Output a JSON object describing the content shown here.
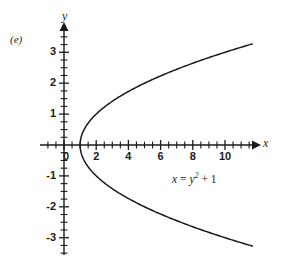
{
  "figure": {
    "panel_label": "(e)",
    "background_color": "#ffffff",
    "ink_color": "#1a1a1a"
  },
  "annotation": {
    "equation_lhs": "x",
    "equation_eq": "=",
    "equation_base": "y",
    "equation_exponent": "2",
    "equation_tail": "+ 1",
    "equation_full": "x = y2 + 1"
  },
  "axes": {
    "x_label": "x",
    "y_label": "y",
    "x_tick_labels": [
      "0",
      "2",
      "4",
      "6",
      "8",
      "10"
    ],
    "x_tick_values": [
      0,
      2,
      4,
      6,
      8,
      10
    ],
    "y_tick_labels": [
      "3",
      "2",
      "1",
      "-1",
      "-2",
      "-3"
    ],
    "y_tick_values": [
      3,
      2,
      1,
      -1,
      -2,
      -3
    ],
    "x_minor_tick_step": 0.5,
    "y_minor_tick_step": 0.25,
    "x_range": [
      -1.5,
      12.3
    ],
    "y_range": [
      -3.8,
      3.8
    ],
    "arrows": [
      "x-positive",
      "y-positive"
    ],
    "grid": false
  },
  "chart_data": {
    "type": "line",
    "title": "",
    "subtitle": "",
    "xlabel": "x",
    "ylabel": "y",
    "xlim": [
      -1.5,
      12.3
    ],
    "ylim": [
      -3.8,
      3.8
    ],
    "grid": false,
    "legend": null,
    "annotations": [
      {
        "text": "x = y^2 + 1",
        "x": 7.0,
        "y": -1.2
      },
      {
        "text": "(e)",
        "x": -1.2,
        "y": 3.0
      }
    ],
    "series": [
      {
        "name": "x = y^2 + 1",
        "relation": "x = y*y + 1",
        "vertex": [
          1,
          0
        ],
        "opens": "right",
        "points": [
          [
            11.5,
            3.24
          ],
          [
            10.0,
            3.0
          ],
          [
            8.0,
            2.65
          ],
          [
            6.0,
            2.24
          ],
          [
            5.0,
            2.0
          ],
          [
            4.0,
            1.73
          ],
          [
            3.0,
            1.41
          ],
          [
            2.0,
            1.0
          ],
          [
            1.5,
            0.71
          ],
          [
            1.25,
            0.5
          ],
          [
            1.0,
            0.0
          ],
          [
            1.25,
            -0.5
          ],
          [
            1.5,
            -0.71
          ],
          [
            2.0,
            -1.0
          ],
          [
            3.0,
            -1.41
          ],
          [
            4.0,
            -1.73
          ],
          [
            5.0,
            -2.0
          ],
          [
            6.0,
            -2.24
          ],
          [
            8.0,
            -2.65
          ],
          [
            10.0,
            -3.0
          ],
          [
            11.5,
            -3.24
          ]
        ]
      }
    ]
  }
}
